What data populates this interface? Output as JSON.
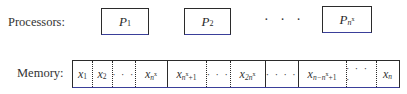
{
  "labels": {
    "processors": "Processors:",
    "memory": "Memory:"
  },
  "processors": [
    {
      "base": "P",
      "sub": "1",
      "sup": ""
    },
    {
      "base": "P",
      "sub": "2",
      "sup": ""
    },
    {
      "ellipsis": "· · ·"
    },
    {
      "base": "P",
      "sub": "n",
      "sup": "x"
    }
  ],
  "memory_cells": [
    {
      "base": "x",
      "sub": "1",
      "sup": "",
      "tail": ""
    },
    {
      "base": "x",
      "sub": "2",
      "sup": "",
      "tail": ""
    },
    {
      "ellipsis": "· · ·"
    },
    {
      "base": "x",
      "sub": "n",
      "sup": "x",
      "tail": ""
    },
    {
      "base": "x",
      "sub": "n",
      "sup": "x",
      "tail": "+1"
    },
    {
      "ellipsis": "· · ·"
    },
    {
      "base": "x",
      "sub": "2n",
      "sup": "x",
      "tail": ""
    },
    {
      "ellipsis": "· · · ·"
    },
    {
      "base": "x",
      "sub": "n−n",
      "sup": "x",
      "tail": "+1"
    },
    {
      "ellipsis": "· · · ·"
    },
    {
      "base": "x",
      "sub": "n",
      "sup": "",
      "tail": ""
    }
  ]
}
